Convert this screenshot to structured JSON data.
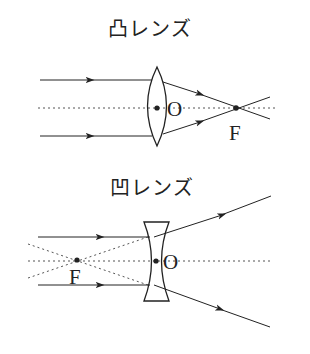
{
  "convex": {
    "title": "凸レンズ",
    "center_label": "O",
    "focus_label": "F"
  },
  "concave": {
    "title": "凹レンズ",
    "center_label": "O",
    "focus_label": "F"
  },
  "colors": {
    "line": "#222222",
    "dotted": "#555555"
  }
}
